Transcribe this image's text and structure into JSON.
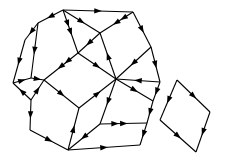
{
  "figure": {
    "background_color": "#ffffff",
    "stroke_color": "#000000",
    "stroke_width": 1.1,
    "arrow_length": 7.5,
    "arrow_half_width": 2.7,
    "canvas": {
      "width": 225,
      "height": 163
    }
  },
  "chart_data": {
    "type": "diagram",
    "node_count": 24,
    "edge_count": 34,
    "nodes": [
      {
        "id": "n0",
        "label": "top-apex",
        "x": 63,
        "y": 10
      },
      {
        "id": "n1",
        "label": "top-right",
        "x": 133,
        "y": 12
      },
      {
        "id": "n2",
        "label": "upper-left-a",
        "x": 38,
        "y": 23
      },
      {
        "id": "n3",
        "label": "upper-right-inner",
        "x": 100,
        "y": 33
      },
      {
        "id": "n4",
        "label": "left-upper",
        "x": 25,
        "y": 40
      },
      {
        "id": "n5",
        "label": "right-upper",
        "x": 151,
        "y": 47
      },
      {
        "id": "n6",
        "label": "left-mid-a",
        "x": 13,
        "y": 83
      },
      {
        "id": "n7",
        "label": "left-mid-b",
        "x": 31,
        "y": 78
      },
      {
        "id": "n8",
        "label": "center-left",
        "x": 44,
        "y": 80
      },
      {
        "id": "n9",
        "label": "center-hub",
        "x": 116,
        "y": 79
      },
      {
        "id": "n10",
        "label": "center-upper",
        "x": 78,
        "y": 53
      },
      {
        "id": "n11",
        "label": "right-mid",
        "x": 160,
        "y": 82
      },
      {
        "id": "n12",
        "label": "center-lower",
        "x": 79,
        "y": 108
      },
      {
        "id": "n13",
        "label": "left-lower-a",
        "x": 31,
        "y": 100
      },
      {
        "id": "n14",
        "label": "left-lower-b",
        "x": 30,
        "y": 130
      },
      {
        "id": "n15",
        "label": "bottom-hub",
        "x": 68,
        "y": 150
      },
      {
        "id": "n16",
        "label": "lower-mid",
        "x": 100,
        "y": 124
      },
      {
        "id": "n17",
        "label": "lower-right-a",
        "x": 147,
        "y": 123
      },
      {
        "id": "n18",
        "label": "bottom-right",
        "x": 140,
        "y": 145
      },
      {
        "id": "n19",
        "label": "right-lower",
        "x": 153,
        "y": 101
      },
      {
        "id": "q0",
        "label": "quad-top",
        "x": 177,
        "y": 80
      },
      {
        "id": "q1",
        "label": "quad-right",
        "x": 210,
        "y": 112
      },
      {
        "id": "q2",
        "label": "quad-bottom",
        "x": 196,
        "y": 152
      },
      {
        "id": "q3",
        "label": "quad-left",
        "x": 160,
        "y": 120
      }
    ],
    "edges": [
      {
        "from": "n0",
        "to": "n1",
        "marker": "mid-forward"
      },
      {
        "from": "n0",
        "to": "n2",
        "marker": "mid-forward"
      },
      {
        "from": "n0",
        "to": "n10",
        "marker": "double-mid"
      },
      {
        "from": "n0",
        "to": "n3",
        "marker": "mid-forward"
      },
      {
        "from": "n1",
        "to": "n3",
        "marker": "double-mid"
      },
      {
        "from": "n1",
        "to": "n5",
        "marker": "mid-forward"
      },
      {
        "from": "n2",
        "to": "n4",
        "marker": "mid-forward"
      },
      {
        "from": "n2",
        "to": "n7",
        "marker": "mid-forward"
      },
      {
        "from": "n4",
        "to": "n6",
        "marker": "mid-forward"
      },
      {
        "from": "n3",
        "to": "n10",
        "marker": "mid-forward"
      },
      {
        "from": "n3",
        "to": "n9",
        "marker": "mid-backward"
      },
      {
        "from": "n5",
        "to": "n9",
        "marker": "mid-forward"
      },
      {
        "from": "n5",
        "to": "n11",
        "marker": "mid-forward"
      },
      {
        "from": "n10",
        "to": "n8",
        "marker": "double-mid"
      },
      {
        "from": "n10",
        "to": "n9",
        "marker": "mid-forward"
      },
      {
        "from": "n6",
        "to": "n7",
        "marker": "mid-forward"
      },
      {
        "from": "n7",
        "to": "n8",
        "marker": "mid-forward"
      },
      {
        "from": "n8",
        "to": "n13",
        "marker": "mid-backward"
      },
      {
        "from": "n8",
        "to": "n12",
        "marker": "mid-forward"
      },
      {
        "from": "n9",
        "to": "n11",
        "marker": "mid-backward"
      },
      {
        "from": "n9",
        "to": "n12",
        "marker": "mid-backward"
      },
      {
        "from": "n9",
        "to": "n16",
        "marker": "mid-forward"
      },
      {
        "from": "n9",
        "to": "n19",
        "marker": "mid-forward"
      },
      {
        "from": "n11",
        "to": "n19",
        "marker": "mid-forward"
      },
      {
        "from": "n6",
        "to": "n13",
        "marker": "mid-backward"
      },
      {
        "from": "n13",
        "to": "n14",
        "marker": "mid-forward"
      },
      {
        "from": "n12",
        "to": "n15",
        "marker": "mid-backward"
      },
      {
        "from": "n14",
        "to": "n15",
        "marker": "mid-forward"
      },
      {
        "from": "n15",
        "to": "n16",
        "marker": "mid-backward"
      },
      {
        "from": "n15",
        "to": "n18",
        "marker": "mid-forward"
      },
      {
        "from": "n16",
        "to": "n17",
        "marker": "double-mid"
      },
      {
        "from": "n17",
        "to": "n18",
        "marker": "mid-forward"
      },
      {
        "from": "n19",
        "to": "n17",
        "marker": "mid-forward"
      },
      {
        "from": "q0",
        "to": "q1",
        "marker": "mid-forward"
      },
      {
        "from": "q0",
        "to": "q3",
        "marker": "mid-forward"
      },
      {
        "from": "q1",
        "to": "q2",
        "marker": "mid-forward"
      },
      {
        "from": "q3",
        "to": "q2",
        "marker": "mid-forward"
      }
    ]
  }
}
